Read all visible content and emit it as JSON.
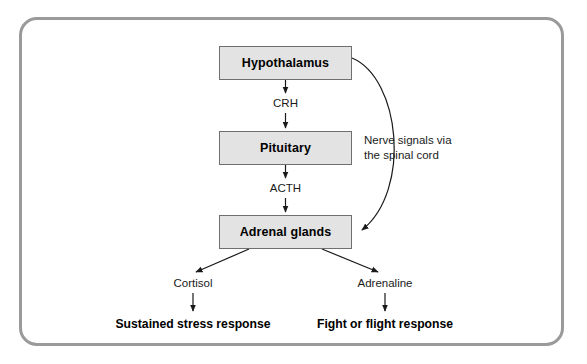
{
  "diagram": {
    "frame": {
      "border_color": "#9a9a9a"
    },
    "box_fill": "#e3e3e3",
    "box_border": "#6f6f6f",
    "nodes": [
      {
        "id": "hypothalamus",
        "label": "Hypothalamus"
      },
      {
        "id": "pituitary",
        "label": "Pituitary"
      },
      {
        "id": "adrenal",
        "label": "Adrenal glands"
      }
    ],
    "edge_labels": [
      {
        "id": "crh",
        "label": "CRH"
      },
      {
        "id": "acth",
        "label": "ACTH"
      },
      {
        "id": "cortisol",
        "label": "Cortisol"
      },
      {
        "id": "adrenaline",
        "label": "Adrenaline"
      }
    ],
    "nerve_pathway": {
      "line1": "Nerve signals via",
      "line2": "the spinal cord"
    },
    "outcomes": [
      {
        "id": "sustained",
        "label": "Sustained stress response"
      },
      {
        "id": "fight",
        "label": "Fight or flight response"
      }
    ]
  }
}
